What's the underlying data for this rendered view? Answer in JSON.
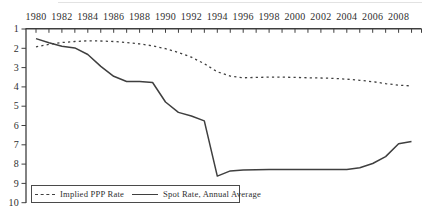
{
  "figure": {
    "background": "#ffffff",
    "line_color": "#3f3f3f",
    "text_color": "#2f2f2f",
    "legend_border_color": "#4a4a4a"
  },
  "chart_data": {
    "type": "line",
    "title": "",
    "xlabel": "",
    "ylabel": "",
    "x_axis_position": "top",
    "y_axis_position": "left",
    "y_axis_inverted": true,
    "grid": false,
    "legend_position": "bottom-left",
    "xlim": [
      1980,
      2010
    ],
    "ylim": [
      1,
      10
    ],
    "x": [
      1980,
      1981,
      1982,
      1983,
      1984,
      1985,
      1986,
      1987,
      1988,
      1989,
      1990,
      1991,
      1992,
      1993,
      1994,
      1995,
      1996,
      1997,
      1998,
      1999,
      2000,
      2001,
      2002,
      2003,
      2004,
      2005,
      2006,
      2007,
      2008,
      2009
    ],
    "x_tick_labels": [
      "1980",
      "1982",
      "1984",
      "1986",
      "1988",
      "1990",
      "1992",
      "1994",
      "1996",
      "1998",
      "2000",
      "2002",
      "2004",
      "2006",
      "2008"
    ],
    "y_ticks": [
      1,
      2,
      3,
      4,
      5,
      6,
      7,
      8,
      9,
      10
    ],
    "series": [
      {
        "name": "Implied PPP Rate",
        "style": "dashed",
        "values": [
          1.93,
          1.8,
          1.7,
          1.65,
          1.61,
          1.62,
          1.65,
          1.7,
          1.77,
          1.87,
          2.02,
          2.22,
          2.46,
          2.8,
          3.22,
          3.44,
          3.53,
          3.51,
          3.49,
          3.49,
          3.51,
          3.53,
          3.54,
          3.56,
          3.6,
          3.66,
          3.73,
          3.83,
          3.91,
          3.95
        ]
      },
      {
        "name": "Spot Rate, Annual Average",
        "style": "solid",
        "values": [
          1.5,
          1.71,
          1.89,
          1.98,
          2.32,
          2.94,
          3.45,
          3.72,
          3.72,
          3.77,
          4.78,
          5.32,
          5.51,
          5.76,
          8.62,
          8.35,
          8.31,
          8.29,
          8.28,
          8.28,
          8.28,
          8.28,
          8.28,
          8.28,
          8.28,
          8.19,
          7.97,
          7.61,
          6.95,
          6.83
        ]
      }
    ]
  }
}
